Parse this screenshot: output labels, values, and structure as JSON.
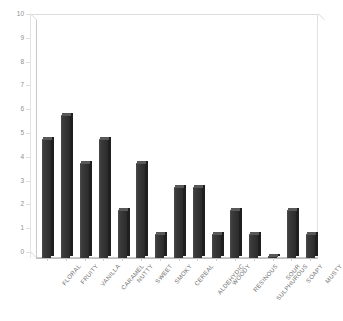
{
  "chart_data": {
    "type": "bar",
    "title": "",
    "subtitle": "",
    "xlabel": "",
    "ylabel": "",
    "ylim": [
      0,
      10
    ],
    "ytick_step": 1,
    "yticks": [
      "0",
      "1",
      "2",
      "3",
      "4",
      "5",
      "6",
      "7",
      "8",
      "9",
      "10"
    ],
    "grid": false,
    "legend": null,
    "legend_position": "none",
    "style": "3d-perspective-frame",
    "bar_color": "#333333",
    "bar_top_color": "#585858",
    "bar_side_color": "#1f1f1f",
    "frame_color": "#c9c9c9",
    "tick_label_color": "#8f8f8f",
    "category_label_color": "#6e6e6e",
    "background_color": "#ffffff",
    "categories": [
      "FLORAL",
      "FRUITY",
      "VANILLA",
      "CARAMEL",
      "NUTTY",
      "SWEET",
      "SMOKY",
      "CEREAL",
      "ALDEHYDIC",
      "WOODY",
      "RESINOUS",
      "SULPHUROUS",
      "SOUR",
      "SOAPY",
      "MUSTY"
    ],
    "values": [
      5,
      6,
      4,
      5,
      2,
      4,
      1,
      3,
      3,
      1,
      2,
      1,
      0.1,
      2,
      1
    ]
  }
}
